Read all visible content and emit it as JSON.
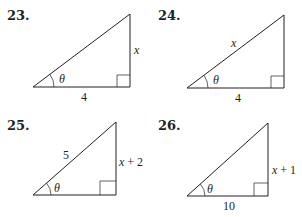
{
  "problems": [
    {
      "number": "23.",
      "angle": "θ",
      "adjacent": "4",
      "opposite": "x",
      "hypotenuse": ""
    },
    {
      "number": "24.",
      "angle": "θ",
      "adjacent": "4",
      "opposite": "",
      "hypotenuse": "x"
    },
    {
      "number": "25.",
      "angle": "θ",
      "adjacent": "",
      "opposite": "x + 2",
      "hypotenuse": "5"
    },
    {
      "number": "26.",
      "angle": "θ",
      "adjacent": "10",
      "opposite": "x + 1",
      "hypotenuse": ""
    }
  ]
}
